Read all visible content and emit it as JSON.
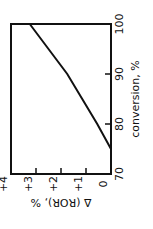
{
  "chart_data": {
    "type": "line",
    "title": "",
    "xlabel": "conversion, %",
    "ylabel": "Δ (ROR), %",
    "orientation": "rotated 90° clockwise (x axis runs vertically on the right, y axis horizontally along the bottom)",
    "xlim": [
      70,
      100
    ],
    "ylim": [
      0,
      4
    ],
    "x_ticks": [
      "70",
      "80",
      "90",
      "100"
    ],
    "y_ticks": [
      "0",
      "+1",
      "+2",
      "+3",
      "+4"
    ],
    "grid": false,
    "legend": null,
    "series": [
      {
        "name": "Δ (ROR)",
        "x": [
          75,
          80,
          85,
          90,
          95,
          100
        ],
        "y": [
          0,
          0.55,
          1.15,
          1.75,
          2.5,
          3.25
        ]
      }
    ]
  },
  "labels": {
    "x_axis": "conversion, %",
    "y_axis": "Δ (ROR), %",
    "x_ticks": [
      "70",
      "80",
      "90",
      "100"
    ],
    "y_ticks": [
      "0",
      "+1",
      "+2",
      "+3",
      "+4"
    ]
  }
}
